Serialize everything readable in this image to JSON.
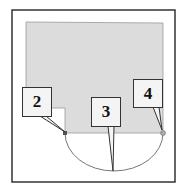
{
  "diagram": {
    "colors": {
      "frame": "#333333",
      "region": "#dcdcdc",
      "region_border": "#999999",
      "arc": "#666666"
    },
    "labels": [
      {
        "id": "2",
        "text": "2"
      },
      {
        "id": "3",
        "text": "3"
      },
      {
        "id": "4",
        "text": "4"
      }
    ]
  }
}
